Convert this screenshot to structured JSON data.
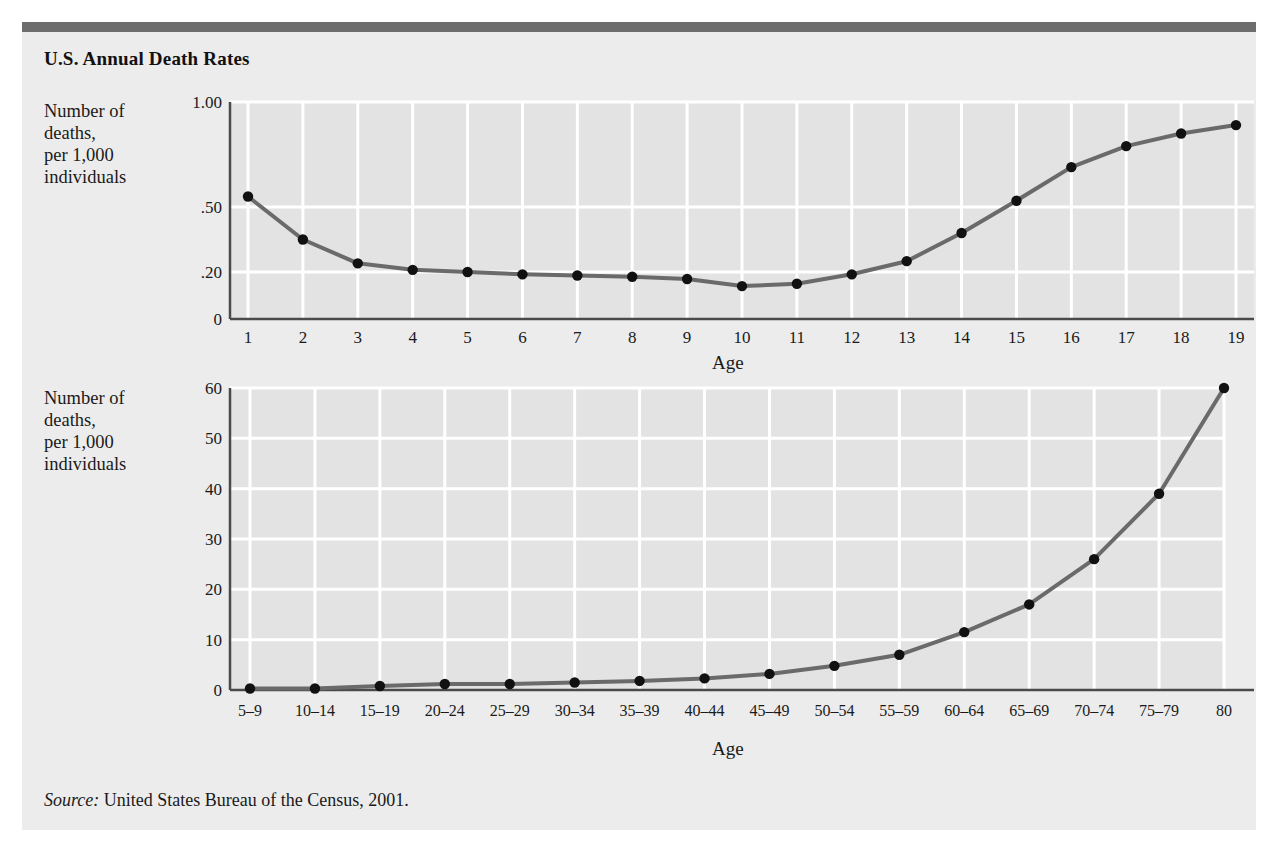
{
  "figure": {
    "title": "U.S. Annual Death Rates",
    "source_label": "Source:",
    "source_text": " United States Bureau of the Census, 2001.",
    "background": "#ececec",
    "rule_color": "#6d6d6d"
  },
  "style": {
    "plot_background": "#e3e3e3",
    "gridline_color": "#ffffff",
    "line_color": "#6a6a6a",
    "marker_color": "#111111",
    "axis_color": "#4a4a4a"
  },
  "chart_data": [
    {
      "id": "top",
      "type": "line",
      "title": "U.S. Annual Death Rates",
      "xlabel": "Age",
      "ylabel": "Number of\ndeaths,\nper 1,000\nindividuals",
      "categories": [
        "1",
        "2",
        "3",
        "4",
        "5",
        "6",
        "7",
        "8",
        "9",
        "10",
        "11",
        "12",
        "13",
        "14",
        "15",
        "16",
        "17",
        "18",
        "19"
      ],
      "values": [
        0.55,
        0.35,
        0.24,
        0.21,
        0.2,
        0.19,
        0.185,
        0.18,
        0.17,
        0.14,
        0.15,
        0.19,
        0.25,
        0.38,
        0.53,
        0.69,
        0.79,
        0.85,
        0.89
      ],
      "ytick_labels": [
        "1.00",
        ".50",
        ".20",
        "0"
      ],
      "ytick_values": [
        1.0,
        0.5,
        0.2,
        0.0
      ],
      "ytick_positions": [
        0,
        105,
        170,
        217
      ],
      "ylim": [
        0,
        1.0
      ],
      "grid": true,
      "note": "y axis is non-linear: 0, .20, .50, 1.00 are unevenly spaced"
    },
    {
      "id": "bottom",
      "type": "line",
      "title": "",
      "xlabel": "Age",
      "ylabel": "Number of\ndeaths,\nper 1,000\nindividuals",
      "categories": [
        "5–9",
        "10–14",
        "15–19",
        "20–24",
        "25–29",
        "30–34",
        "35–39",
        "40–44",
        "45–49",
        "50–54",
        "55–59",
        "60–64",
        "65–69",
        "70–74",
        "75–79",
        "80"
      ],
      "values": [
        0.3,
        0.3,
        0.8,
        1.2,
        1.2,
        1.5,
        1.8,
        2.3,
        3.2,
        4.8,
        7.0,
        11.5,
        17.0,
        26.0,
        39.0,
        60.0
      ],
      "ytick_labels": [
        "60",
        "50",
        "40",
        "30",
        "20",
        "10",
        "0"
      ],
      "ytick_values": [
        60,
        50,
        40,
        30,
        20,
        10,
        0
      ],
      "ylim": [
        0,
        60
      ],
      "grid": true
    }
  ]
}
